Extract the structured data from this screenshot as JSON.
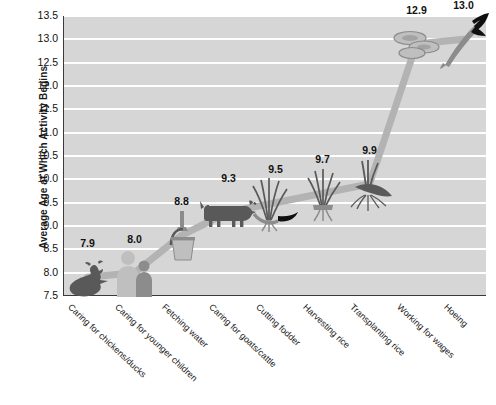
{
  "chart_data": {
    "type": "line",
    "title": "",
    "xlabel": "",
    "ylabel": "Average Age at Which Activity Begins",
    "ylim": [
      7.5,
      13.5
    ],
    "ytick_step": 0.5,
    "grid": true,
    "legend": "none",
    "categories": [
      "Caring for chickens/ducks",
      "Caring for younger children",
      "Fetching water",
      "Caring for goats/cattle",
      "Cutting fodder",
      "Harvesting  rice",
      "Transplanting rice",
      "Working for wages",
      "Hoeing"
    ],
    "values": [
      7.9,
      8.0,
      8.8,
      9.3,
      9.5,
      9.7,
      9.9,
      12.9,
      13.0
    ],
    "value_labels": [
      "7.9",
      "8.0",
      "8.8",
      "9.3",
      "9.5",
      "9.7",
      "9.9",
      "12.9",
      "13.0"
    ],
    "yticks": [
      "13.5",
      "13.0",
      "12.5",
      "12.0",
      "11.5",
      "11.0",
      "10.5",
      "10.0",
      "9.5",
      "9.0",
      "8.5",
      "8.0",
      "7.5"
    ],
    "markers": [
      "rooster-icon",
      "two-children-icon",
      "water-bucket-icon",
      "cow-icon",
      "fodder-grass-sickle-icon",
      "rice-bundle-icon",
      "rice-seedling-icon",
      "coins-money-icon",
      "hoe-tool-icon"
    ],
    "colors": {
      "plot_background": "#d6d6d6",
      "gridline": "#ffffff",
      "line": "#b3b3b3",
      "marker_dark": "#595959",
      "marker_mid": "#8c8c8c",
      "marker_light": "#bfbfbf",
      "text": "#111111",
      "axis": "#3a3a3a",
      "page_background": "#ffffff"
    }
  }
}
